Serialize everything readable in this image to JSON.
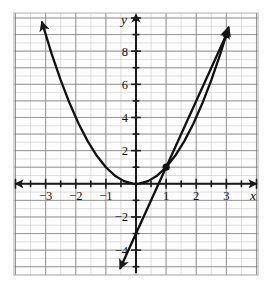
{
  "figure": {
    "kind": "cartesian-graph",
    "background_color": "#ffffff",
    "plot_area": {
      "x": 14,
      "y": 13,
      "width": 244,
      "height": 262
    },
    "minor_grid_color": "#c9c9c9",
    "major_grid_color": "#8f8f8f",
    "axis_color": "#1a1a1a",
    "curve_color": "#111111",
    "point_color": "#111111"
  },
  "axes": {
    "x_label": "x",
    "y_label": "y",
    "x_ticks": [
      -3,
      -2,
      -1,
      1,
      2,
      3
    ],
    "x_tick_labels": [
      "−3",
      "−2",
      "−1",
      "1",
      "2",
      "3"
    ],
    "y_ticks": [
      8,
      6,
      4,
      2,
      -2,
      -4
    ],
    "y_tick_labels": [
      "8",
      "6",
      "4",
      "2",
      "−2",
      "−4"
    ],
    "x_range": [
      -4.05,
      4.05
    ],
    "y_range": [
      -5.5,
      10.3
    ],
    "x_minor_step": 0.5,
    "y_minor_step": 0.5,
    "x_major_step": 1,
    "y_major_step": 1
  },
  "chart_data": {
    "type": "line",
    "title": "",
    "xlabel": "x",
    "ylabel": "y",
    "xlim": [
      -4.05,
      4.05
    ],
    "ylim": [
      -5.5,
      10.3
    ],
    "grid": true,
    "legend": "none",
    "series": [
      {
        "name": "parabola",
        "equation": "y = x^2",
        "style": "solid",
        "arrows": [
          "start",
          "end"
        ],
        "x": [
          -3.12,
          -2.8,
          -2.5,
          -2.2,
          -1.9,
          -1.6,
          -1.3,
          -1.0,
          -0.7,
          -0.4,
          -0.1,
          0,
          0.1,
          0.4,
          0.7,
          1.0,
          1.3,
          1.6,
          1.9,
          2.2,
          2.5,
          2.8,
          3.07
        ],
        "y": [
          9.73,
          7.84,
          6.25,
          4.84,
          3.61,
          2.56,
          1.69,
          1.0,
          0.49,
          0.16,
          0.01,
          0,
          0.01,
          0.16,
          0.49,
          1.0,
          1.69,
          2.56,
          3.61,
          4.84,
          6.25,
          7.84,
          9.42
        ]
      },
      {
        "name": "line",
        "equation": "y = 4x - 3",
        "style": "solid",
        "arrows": [
          "start",
          "end"
        ],
        "x": [
          -0.52,
          3.07
        ],
        "y": [
          -5.08,
          9.28
        ]
      }
    ],
    "points": [
      {
        "label": "(1, 1)",
        "x": 1,
        "y": 1,
        "marker": "filled-circle"
      },
      {
        "label": "(3, 9)",
        "x": 3,
        "y": 9,
        "marker": "filled-circle"
      }
    ],
    "annotations": []
  }
}
